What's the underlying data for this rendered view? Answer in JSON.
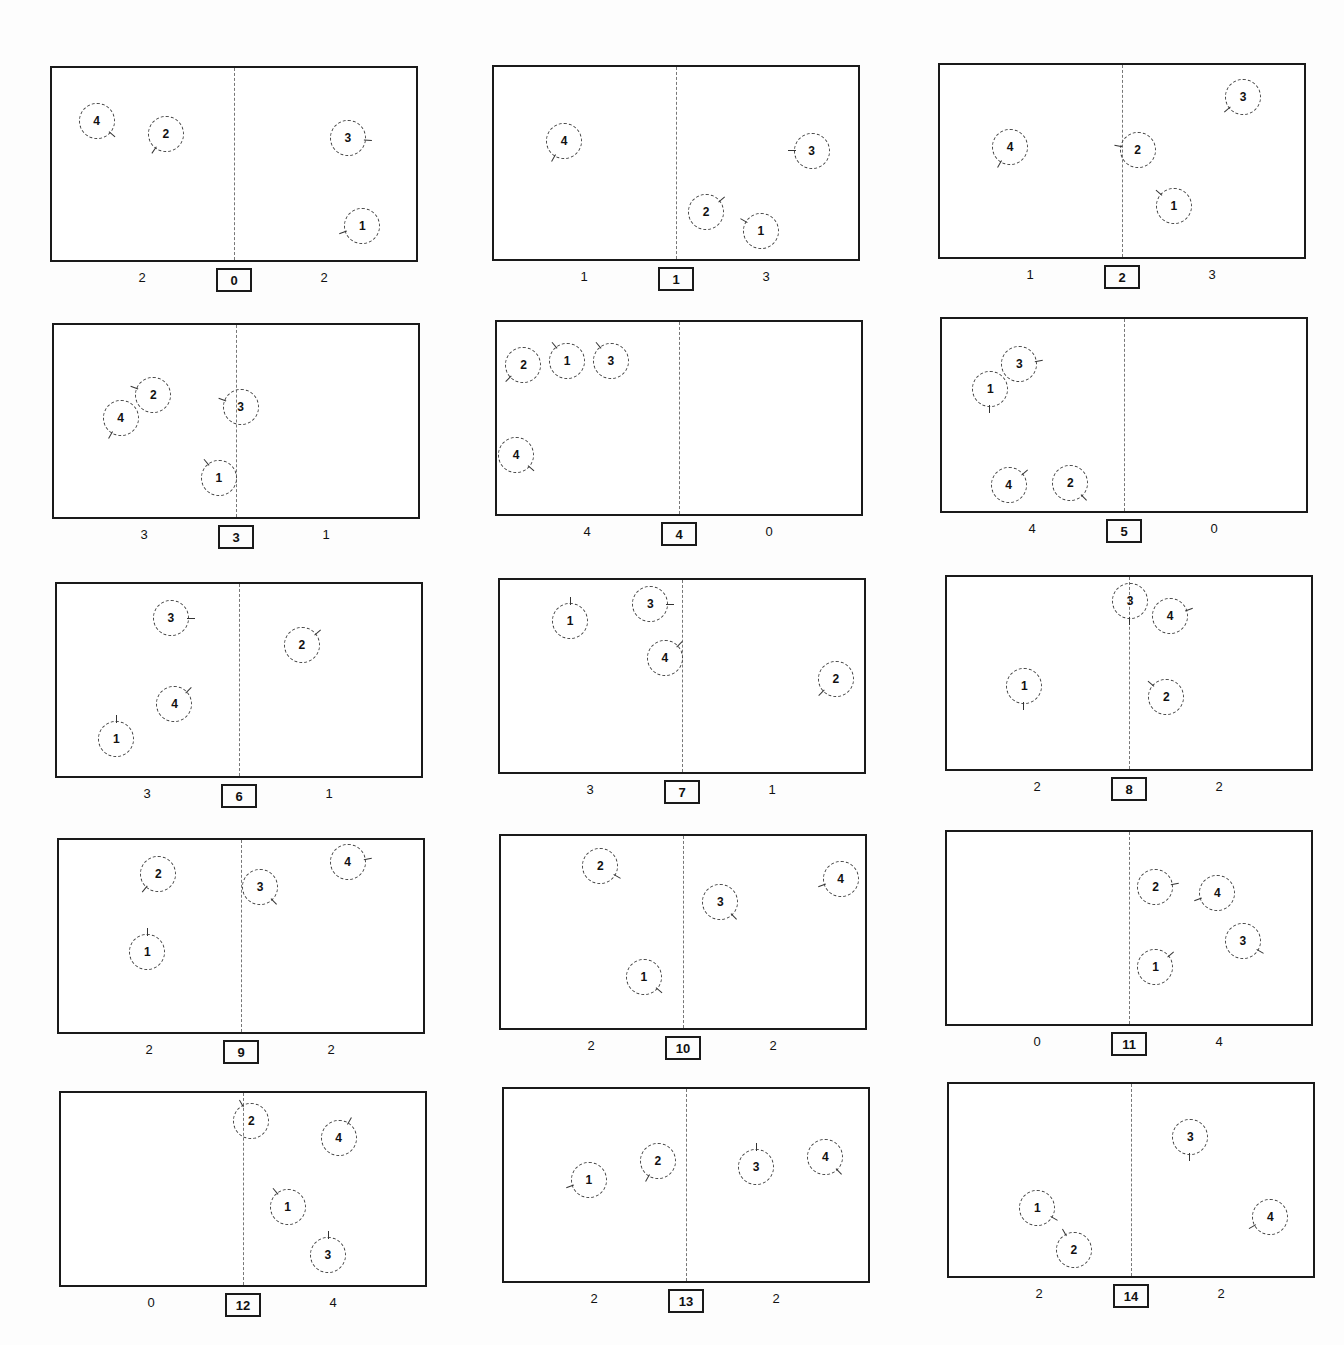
{
  "figure": {
    "panels": [
      {
        "frame": "0",
        "left_count": "2",
        "right_count": "2",
        "x": 50,
        "y": 66,
        "agents": [
          {
            "id": "4",
            "fx": 0.12,
            "fy": 0.27,
            "dir": 40
          },
          {
            "id": "2",
            "fx": 0.31,
            "fy": 0.34,
            "dir": 125
          },
          {
            "id": "3",
            "fx": 0.81,
            "fy": 0.36,
            "dir": 5
          },
          {
            "id": "1",
            "fx": 0.85,
            "fy": 0.82,
            "dir": 160
          }
        ]
      },
      {
        "frame": "1",
        "left_count": "1",
        "right_count": "3",
        "x": 492,
        "y": 65,
        "agents": [
          {
            "id": "4",
            "fx": 0.19,
            "fy": 0.38,
            "dir": 120
          },
          {
            "id": "3",
            "fx": 0.87,
            "fy": 0.43,
            "dir": 180
          },
          {
            "id": "2",
            "fx": 0.58,
            "fy": 0.75,
            "dir": -40
          },
          {
            "id": "1",
            "fx": 0.73,
            "fy": 0.85,
            "dir": -150
          }
        ]
      },
      {
        "frame": "2",
        "left_count": "1",
        "right_count": "3",
        "x": 938,
        "y": 63,
        "agents": [
          {
            "id": "3",
            "fx": 0.83,
            "fy": 0.16,
            "dir": 140
          },
          {
            "id": "4",
            "fx": 0.19,
            "fy": 0.42,
            "dir": 120
          },
          {
            "id": "2",
            "fx": 0.54,
            "fy": 0.44,
            "dir": -170
          },
          {
            "id": "1",
            "fx": 0.64,
            "fy": 0.73,
            "dir": -140
          }
        ]
      },
      {
        "frame": "3",
        "left_count": "3",
        "right_count": "1",
        "x": 52,
        "y": 323,
        "agents": [
          {
            "id": "2",
            "fx": 0.27,
            "fy": 0.36,
            "dir": -160
          },
          {
            "id": "4",
            "fx": 0.18,
            "fy": 0.48,
            "dir": 120
          },
          {
            "id": "3",
            "fx": 0.51,
            "fy": 0.42,
            "dir": -160
          },
          {
            "id": "1",
            "fx": 0.45,
            "fy": 0.79,
            "dir": -130
          }
        ]
      },
      {
        "frame": "4",
        "left_count": "4",
        "right_count": "0",
        "x": 495,
        "y": 320,
        "agents": [
          {
            "id": "2",
            "fx": 0.07,
            "fy": 0.22,
            "dir": 135
          },
          {
            "id": "1",
            "fx": 0.19,
            "fy": 0.2,
            "dir": -130
          },
          {
            "id": "3",
            "fx": 0.31,
            "fy": 0.2,
            "dir": -130
          },
          {
            "id": "4",
            "fx": 0.05,
            "fy": 0.69,
            "dir": 40
          }
        ]
      },
      {
        "frame": "5",
        "left_count": "4",
        "right_count": "0",
        "x": 940,
        "y": 317,
        "agents": [
          {
            "id": "3",
            "fx": 0.21,
            "fy": 0.23,
            "dir": -10
          },
          {
            "id": "1",
            "fx": 0.13,
            "fy": 0.36,
            "dir": 90
          },
          {
            "id": "4",
            "fx": 0.18,
            "fy": 0.86,
            "dir": -40
          },
          {
            "id": "2",
            "fx": 0.35,
            "fy": 0.85,
            "dir": 45
          }
        ]
      },
      {
        "frame": "6",
        "left_count": "3",
        "right_count": "1",
        "x": 55,
        "y": 582,
        "agents": [
          {
            "id": "3",
            "fx": 0.31,
            "fy": 0.17,
            "dir": 0
          },
          {
            "id": "2",
            "fx": 0.67,
            "fy": 0.31,
            "dir": -40
          },
          {
            "id": "4",
            "fx": 0.32,
            "fy": 0.62,
            "dir": -45
          },
          {
            "id": "1",
            "fx": 0.16,
            "fy": 0.8,
            "dir": -90
          }
        ]
      },
      {
        "frame": "7",
        "left_count": "3",
        "right_count": "1",
        "x": 498,
        "y": 578,
        "agents": [
          {
            "id": "1",
            "fx": 0.19,
            "fy": 0.21,
            "dir": -90
          },
          {
            "id": "3",
            "fx": 0.41,
            "fy": 0.12,
            "dir": 0
          },
          {
            "id": "4",
            "fx": 0.45,
            "fy": 0.4,
            "dir": -45
          },
          {
            "id": "2",
            "fx": 0.92,
            "fy": 0.51,
            "dir": 135
          }
        ]
      },
      {
        "frame": "8",
        "left_count": "2",
        "right_count": "2",
        "x": 945,
        "y": 575,
        "agents": [
          {
            "id": "3",
            "fx": 0.5,
            "fy": 0.12,
            "dir": 90
          },
          {
            "id": "4",
            "fx": 0.61,
            "fy": 0.2,
            "dir": -20
          },
          {
            "id": "1",
            "fx": 0.21,
            "fy": 0.56,
            "dir": 90
          },
          {
            "id": "2",
            "fx": 0.6,
            "fy": 0.62,
            "dir": -140
          }
        ]
      },
      {
        "frame": "9",
        "left_count": "2",
        "right_count": "2",
        "x": 57,
        "y": 838,
        "agents": [
          {
            "id": "2",
            "fx": 0.27,
            "fy": 0.17,
            "dir": 130
          },
          {
            "id": "3",
            "fx": 0.55,
            "fy": 0.24,
            "dir": 45
          },
          {
            "id": "4",
            "fx": 0.79,
            "fy": 0.11,
            "dir": -10
          },
          {
            "id": "1",
            "fx": 0.24,
            "fy": 0.58,
            "dir": -90
          }
        ]
      },
      {
        "frame": "10",
        "left_count": "2",
        "right_count": "2",
        "x": 499,
        "y": 834,
        "agents": [
          {
            "id": "2",
            "fx": 0.27,
            "fy": 0.15,
            "dir": 30
          },
          {
            "id": "3",
            "fx": 0.6,
            "fy": 0.34,
            "dir": 45
          },
          {
            "id": "4",
            "fx": 0.93,
            "fy": 0.22,
            "dir": 160
          },
          {
            "id": "1",
            "fx": 0.39,
            "fy": 0.73,
            "dir": 40
          }
        ]
      },
      {
        "frame": "11",
        "left_count": "0",
        "right_count": "4",
        "x": 945,
        "y": 830,
        "agents": [
          {
            "id": "2",
            "fx": 0.57,
            "fy": 0.28,
            "dir": -10
          },
          {
            "id": "4",
            "fx": 0.74,
            "fy": 0.31,
            "dir": 160
          },
          {
            "id": "3",
            "fx": 0.81,
            "fy": 0.56,
            "dir": 30
          },
          {
            "id": "1",
            "fx": 0.57,
            "fy": 0.7,
            "dir": -40
          }
        ]
      },
      {
        "frame": "12",
        "left_count": "0",
        "right_count": "4",
        "x": 59,
        "y": 1091,
        "agents": [
          {
            "id": "2",
            "fx": 0.52,
            "fy": 0.14,
            "dir": -120
          },
          {
            "id": "4",
            "fx": 0.76,
            "fy": 0.23,
            "dir": -60
          },
          {
            "id": "1",
            "fx": 0.62,
            "fy": 0.59,
            "dir": -130
          },
          {
            "id": "3",
            "fx": 0.73,
            "fy": 0.84,
            "dir": -90
          }
        ]
      },
      {
        "frame": "13",
        "left_count": "2",
        "right_count": "2",
        "x": 502,
        "y": 1087,
        "agents": [
          {
            "id": "1",
            "fx": 0.23,
            "fy": 0.47,
            "dir": 160
          },
          {
            "id": "2",
            "fx": 0.42,
            "fy": 0.37,
            "dir": 120
          },
          {
            "id": "3",
            "fx": 0.69,
            "fy": 0.4,
            "dir": -90
          },
          {
            "id": "4",
            "fx": 0.88,
            "fy": 0.35,
            "dir": 45
          }
        ]
      },
      {
        "frame": "14",
        "left_count": "2",
        "right_count": "2",
        "x": 947,
        "y": 1082,
        "agents": [
          {
            "id": "3",
            "fx": 0.66,
            "fy": 0.27,
            "dir": 90
          },
          {
            "id": "1",
            "fx": 0.24,
            "fy": 0.64,
            "dir": 30
          },
          {
            "id": "2",
            "fx": 0.34,
            "fy": 0.86,
            "dir": -120
          },
          {
            "id": "4",
            "fx": 0.88,
            "fy": 0.69,
            "dir": 150
          }
        ]
      }
    ]
  }
}
